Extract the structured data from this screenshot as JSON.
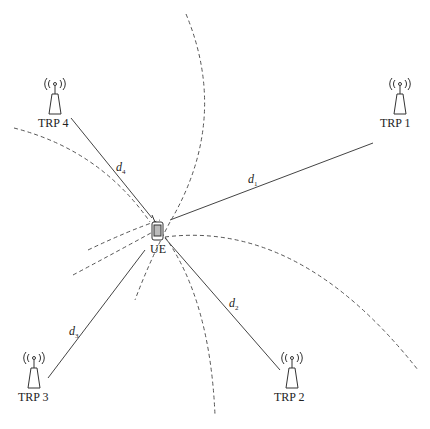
{
  "diagram": {
    "type": "positioning-multilateration",
    "ue": {
      "label": "UE",
      "x": 157,
      "y": 230
    },
    "trps": [
      {
        "label": "TRP 1",
        "x": 400,
        "y": 100
      },
      {
        "label": "TRP 2",
        "x": 292,
        "y": 375
      },
      {
        "label": "TRP 3",
        "x": 32,
        "y": 375
      },
      {
        "label": "TRP 4",
        "x": 55,
        "y": 95
      }
    ],
    "distances": [
      {
        "symbol": "d",
        "sub": "1"
      },
      {
        "symbol": "d",
        "sub": "2"
      },
      {
        "symbol": "d",
        "sub": "3"
      },
      {
        "symbol": "d",
        "sub": "4"
      }
    ],
    "colors": {
      "line": "#444444",
      "dash": "#555555",
      "text": "#222222"
    }
  }
}
